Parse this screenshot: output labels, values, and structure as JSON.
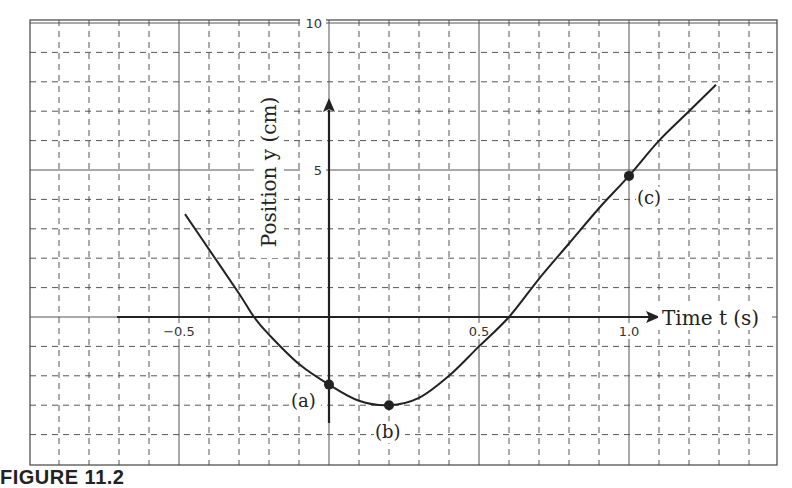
{
  "figure": {
    "caption_label": "FIGURE 11.2"
  },
  "chart_data": {
    "type": "line",
    "title": "",
    "xlabel": "Time t (s)",
    "ylabel": "Position y (cm)",
    "xlim": [
      -1.0,
      1.5
    ],
    "ylim": [
      -4,
      10
    ],
    "grid": true,
    "x_ticks": [
      {
        "value": -0.5,
        "label": "-0.5"
      },
      {
        "value": 0.5,
        "label": "0.5"
      },
      {
        "value": 1.0,
        "label": "1.0"
      }
    ],
    "y_ticks": [
      {
        "value": 5,
        "label": "5"
      },
      {
        "value": 10,
        "label": "10"
      }
    ],
    "series": [
      {
        "name": "position",
        "x": [
          -0.48,
          -0.4,
          -0.3,
          -0.25,
          -0.2,
          -0.1,
          0.0,
          0.1,
          0.2,
          0.3,
          0.4,
          0.5,
          0.6,
          0.7,
          0.8,
          0.9,
          1.0,
          1.1,
          1.2,
          1.29
        ],
        "y": [
          3.5,
          2.3,
          0.8,
          0.0,
          -0.6,
          -1.6,
          -2.3,
          -2.85,
          -3.0,
          -2.75,
          -2.0,
          -1.0,
          0.0,
          1.3,
          2.5,
          3.7,
          4.8,
          6.0,
          7.0,
          7.9
        ]
      }
    ],
    "annotations": [
      {
        "label": "(a)",
        "x": 0.0,
        "y": -2.3
      },
      {
        "label": "(b)",
        "x": 0.2,
        "y": -3.0
      },
      {
        "label": "(c)",
        "x": 1.0,
        "y": 4.8
      }
    ]
  }
}
